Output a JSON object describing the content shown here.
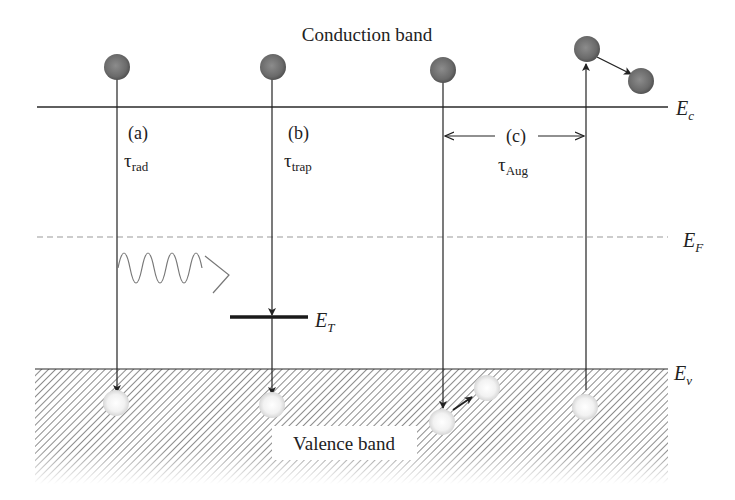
{
  "title": "Conduction band",
  "bottom_label": "Valence band",
  "levels": {
    "Ec": {
      "label": "E",
      "sub": "c",
      "y": 107
    },
    "EF": {
      "label": "E",
      "sub": "F",
      "y": 237
    },
    "ET": {
      "label": "E",
      "sub": "T",
      "y": 317
    },
    "Ev": {
      "label": "E",
      "sub": "v",
      "y": 369
    }
  },
  "processes": [
    {
      "id": "a",
      "label": "(a)",
      "tau": "τ",
      "tau_sub": "rad",
      "name": "radiative recombination"
    },
    {
      "id": "b",
      "label": "(b)",
      "tau": "τ",
      "tau_sub": "trap",
      "name": "trap-assisted recombination"
    },
    {
      "id": "c",
      "label": "(c)",
      "tau": "τ",
      "tau_sub": "Aug",
      "name": "Auger recombination"
    }
  ],
  "colors": {
    "electron": "#6e6e6e",
    "hole": "#f4f4f4",
    "line": "#2a2a2a",
    "hatch": "#555555"
  }
}
